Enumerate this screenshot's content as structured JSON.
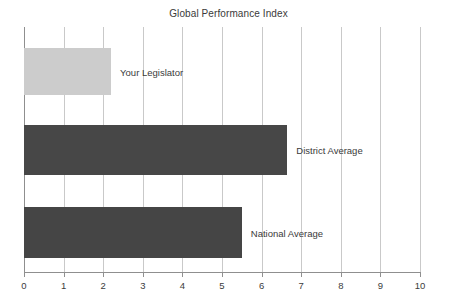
{
  "chart_data": {
    "type": "bar",
    "orientation": "horizontal",
    "title": "Global Performance Index",
    "xlabel": "",
    "ylabel": "",
    "xlim": [
      0,
      10
    ],
    "ylim": null,
    "grid": true,
    "legend": null,
    "categories": [
      "Your Legislator",
      "District Average",
      "National Average"
    ],
    "values": [
      2.2,
      6.65,
      5.5
    ],
    "xticks": [
      0,
      1,
      2,
      3,
      4,
      5,
      6,
      7,
      8,
      9,
      10
    ],
    "xtick_labels": [
      "0",
      "1",
      "2",
      "3",
      "4",
      "5",
      "6",
      "7",
      "8",
      "9",
      "10"
    ],
    "series": [
      {
        "name": "Global Performance Index",
        "values": [
          2.2,
          6.65,
          5.5
        ]
      }
    ],
    "bars": [
      {
        "label": "Your Legislator",
        "value": 2.2,
        "color": "#cccccc"
      },
      {
        "label": "District Average",
        "value": 6.65,
        "color": "#474747"
      },
      {
        "label": "National Average",
        "value": 5.5,
        "color": "#454545"
      }
    ]
  },
  "colors": {
    "background": "#ffffff",
    "gridline": "#c9c9c9",
    "axis": "#8f8f8f",
    "text": "#3c3c3c",
    "bar_light": "#cccccc",
    "bar_dark": "#474747",
    "bar_dark_alt": "#454545"
  }
}
